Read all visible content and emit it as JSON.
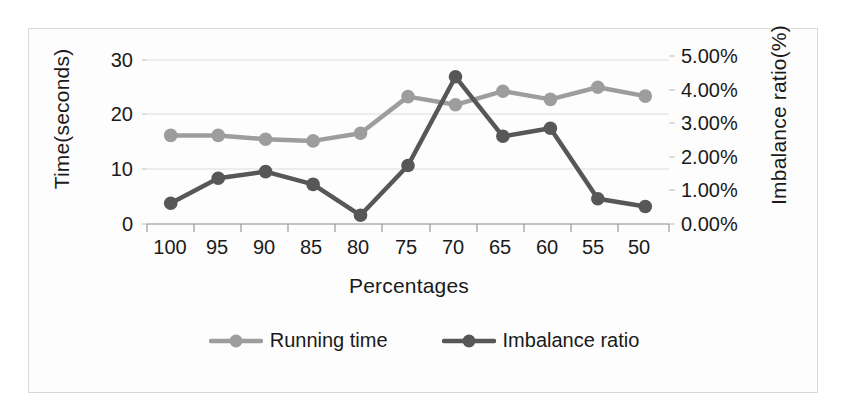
{
  "chart_data": {
    "type": "line",
    "title": "",
    "xlabel": "Percentages",
    "ylabel": "Time(seconds)",
    "y2label": "Imbalance ratio(%)",
    "categories": [
      "100",
      "95",
      "90",
      "85",
      "80",
      "75",
      "70",
      "65",
      "60",
      "55",
      "50"
    ],
    "ylim": [
      0,
      30
    ],
    "yticks": [
      "0",
      "10",
      "20",
      "30"
    ],
    "y2lim": [
      0,
      5
    ],
    "y2ticks": [
      "0.00%",
      "1.00%",
      "2.00%",
      "3.00%",
      "4.00%",
      "5.00%"
    ],
    "grid": true,
    "legend_position": "bottom",
    "series": [
      {
        "name": "Running time",
        "axis": "left",
        "color": "#9d9d9d",
        "values": [
          16.2,
          16.2,
          15.5,
          15.2,
          16.6,
          23.3,
          21.8,
          24.3,
          22.8,
          25.0,
          23.4
        ]
      },
      {
        "name": "Imbalance ratio",
        "axis": "right",
        "color": "#575757",
        "values": [
          0.62,
          1.36,
          1.56,
          1.18,
          0.26,
          1.74,
          4.38,
          2.61,
          2.85,
          0.75,
          0.52
        ]
      }
    ]
  },
  "legend": {
    "items": [
      {
        "label": "Running time",
        "color": "#9d9d9d"
      },
      {
        "label": "Imbalance ratio",
        "color": "#575757"
      }
    ]
  },
  "axes": {
    "x_title": "Percentages",
    "y_left_title": "Time(seconds)",
    "y_right_title": "Imbalance ratio(%)"
  }
}
